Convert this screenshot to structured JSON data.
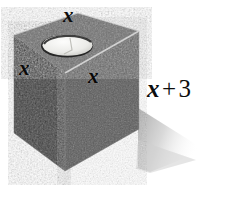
{
  "figure": {
    "shape_name": "rectangular box with cylindrical hole",
    "material_appearance": "speckled concrete gray",
    "colors": {
      "background": "#ffffff",
      "top_face": "#6e6e6e",
      "left_face": "#3d3d3d",
      "front_face": "#585858",
      "hole_interior": "#e8e8e6",
      "hole_rim_shadow": "#2a2a2a",
      "edge_highlight": "#c9c9c9",
      "drop_shadow": "#c6c6c6",
      "label_color": "#0d0d0d"
    }
  },
  "labels": {
    "top_edge": "x",
    "left_face": "x",
    "front_edge": "x",
    "height": {
      "variable": "x",
      "operator": "+",
      "constant": "3",
      "full": "x + 3"
    }
  }
}
